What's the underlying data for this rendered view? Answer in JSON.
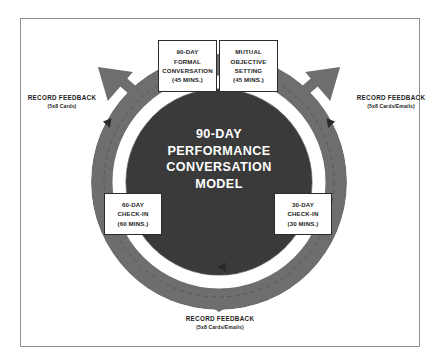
{
  "diagram": {
    "type": "cycle-diagram",
    "center": {
      "lines": [
        "90-DAY",
        "PERFORMANCE",
        "CONVERSATION",
        "MODEL"
      ],
      "text_color": "#ffffff",
      "fill_color": "#3a3a3a"
    },
    "colors": {
      "ring": "#6e6e6e",
      "ring_gap": "#ffffff",
      "inner_circle": "#3a3a3a",
      "box_border": "#2b2b2b",
      "box_fill": "#ffffff",
      "text_dark": "#1d1d1d",
      "frame_border": "#8e8e8e",
      "page_background": "#ffffff",
      "marker": "#2b2b2b"
    },
    "stage_boxes": [
      {
        "id": "formal-conversation",
        "position": "top-left",
        "lines": [
          "90-DAY",
          "FORMAL",
          "CONVERSATION",
          "(45 MINS.)"
        ]
      },
      {
        "id": "mutual-objective-setting",
        "position": "top-right",
        "lines": [
          "MUTUAL",
          "OBJECTIVE",
          "SETTING",
          "(45 MINS.)"
        ]
      },
      {
        "id": "sixty-day-check-in",
        "position": "left",
        "lines": [
          "60-DAY",
          "CHECK-IN",
          "(60 MINS.)"
        ]
      },
      {
        "id": "thirty-day-check-in",
        "position": "right",
        "lines": [
          "30-DAY",
          "CHECK-IN",
          "(30 MINS.)"
        ]
      }
    ],
    "feedback_labels": [
      {
        "id": "feedback-left",
        "position": "left",
        "title": "RECORD FEEDBACK",
        "subtitle": "(5x8 Cards)"
      },
      {
        "id": "feedback-right",
        "position": "right",
        "title": "RECORD FEEDBACK",
        "subtitle": "(5x8 Cards/Emails)"
      },
      {
        "id": "feedback-bottom",
        "position": "bottom",
        "title": "RECORD FEEDBACK",
        "subtitle": "(5x8 Cards/Emails)"
      }
    ],
    "arrows": [
      {
        "id": "arrow-upper-left",
        "direction": "outward-upper-left"
      },
      {
        "id": "arrow-upper-right",
        "direction": "outward-upper-right"
      },
      {
        "id": "arrow-bottom",
        "direction": "outward-down"
      }
    ],
    "flow_markers": [
      {
        "id": "marker-left",
        "direction": "counter-clockwise"
      },
      {
        "id": "marker-right",
        "direction": "clockwise"
      },
      {
        "id": "marker-bottom",
        "direction": "flow"
      }
    ]
  }
}
